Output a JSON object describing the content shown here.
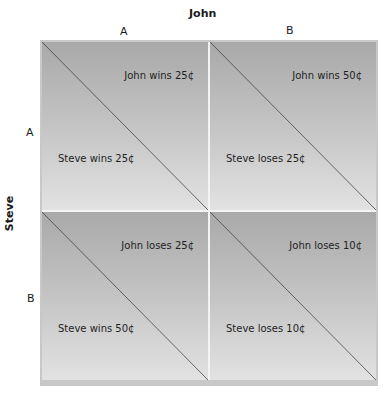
{
  "column_player": {
    "name": "John",
    "strategies": [
      "A",
      "B"
    ]
  },
  "row_player": {
    "name": "Steve",
    "strategies": [
      "A",
      "B"
    ]
  },
  "cells": [
    {
      "row": "A",
      "col": "A",
      "john": "John wins 25¢",
      "steve": "Steve wins 25¢"
    },
    {
      "row": "A",
      "col": "B",
      "john": "John wins 50¢",
      "steve": "Steve loses 25¢"
    },
    {
      "row": "B",
      "col": "A",
      "john": "John loses 25¢",
      "steve": "Steve wins 50¢"
    },
    {
      "row": "B",
      "col": "B",
      "john": "John loses 10¢",
      "steve": "Steve loses 10¢"
    }
  ],
  "colors": {
    "cell_top": "#a9a9a9",
    "cell_bottom": "#e2e2e2",
    "frame": "#c8c8c8",
    "divider": "#f3f3f3",
    "diagonal": "#333333"
  }
}
